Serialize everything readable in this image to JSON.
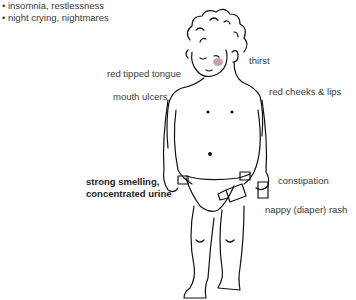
{
  "top_list": [
    "• insomnia, restlessness",
    "• night crying, nightmares"
  ],
  "labels": {
    "thirst": "thirst",
    "red_tipped_tongue": "red tipped tongue",
    "mouth_ulcers": "mouth ulcers",
    "red_cheeks_lips": "red cheeks & lips",
    "urine_line1": "strong smelling,",
    "urine_line2": "concentrated urine",
    "constipation": "constipation",
    "nappy_rash": "nappy (diaper) rash"
  },
  "colors": {
    "cheek": "#c9a0b8",
    "line": "#111111"
  }
}
